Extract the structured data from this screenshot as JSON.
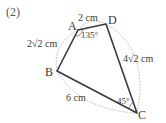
{
  "problem_number": "(2)",
  "vertices": {
    "A": {
      "label": "A"
    },
    "B": {
      "label": "B"
    },
    "C": {
      "label": "C"
    },
    "D": {
      "label": "D"
    }
  },
  "measurements": {
    "AD": "2 cm",
    "AB": "2√2 cm",
    "DC": "4√2 cm",
    "BC": "6 cm",
    "angle_A": "135°",
    "angle_C": "45°"
  },
  "colors": {
    "edge": "#3a3a3a",
    "dotted": "#9a9a9a",
    "text": "#3a3a3a"
  }
}
